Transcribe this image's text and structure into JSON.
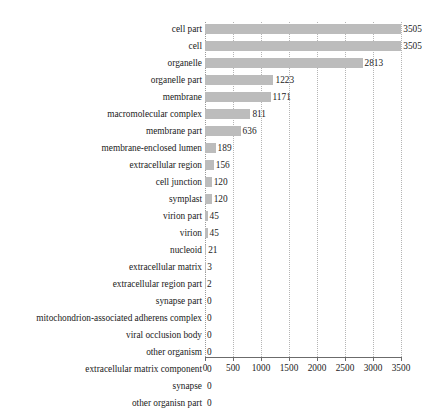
{
  "chart_data": {
    "type": "bar",
    "orientation": "horizontal",
    "title": "",
    "subtitle": "",
    "xlabel": "",
    "ylabel": "",
    "xlim": [
      0,
      3500
    ],
    "xticks": [
      0,
      500,
      1000,
      1500,
      2000,
      2500,
      3000,
      3500
    ],
    "xtick_labels": [
      "0",
      "500",
      "1000",
      "1500",
      "2000",
      "2500",
      "3000",
      "3500"
    ],
    "grid": "vertical-dotted",
    "legend": "none",
    "bar_color": "#bcbcbc",
    "categories": [
      "cell part",
      "cell",
      "organelle",
      "organelle part",
      "membrane",
      "macromolecular complex",
      "membrane part",
      "membrane-enclosed lumen",
      "extracellular region",
      "cell junction",
      "symplast",
      "virion part",
      "virion",
      "nucleoid",
      "extracellular matrix",
      "extracellular region part",
      "synapse part",
      "mitochondrion-associated adherens complex",
      "viral occlusion body",
      "other organism",
      "extracellular matrix component",
      "synapse",
      "other organisn part"
    ],
    "values": [
      3505,
      3505,
      2813,
      1223,
      1171,
      811,
      636,
      189,
      156,
      120,
      120,
      45,
      45,
      21,
      3,
      2,
      0,
      0,
      0,
      0,
      0,
      0,
      0
    ],
    "value_labels": [
      "3505",
      "3505",
      "2813",
      "1223",
      "1171",
      "811",
      "636",
      "189",
      "156",
      "120",
      "120",
      "45",
      "45",
      "21",
      "3",
      "2",
      "0",
      "0",
      "0",
      "0",
      "0",
      "0",
      "0"
    ]
  }
}
